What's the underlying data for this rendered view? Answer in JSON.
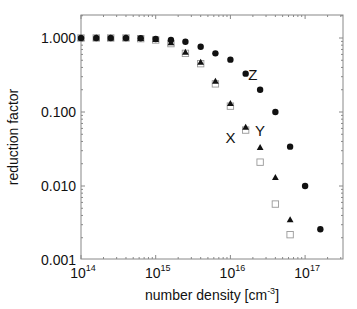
{
  "chart_data": {
    "type": "scatter",
    "title": "",
    "xlabel": "number density [cm^-3]",
    "xlabel_base": "number density [cm",
    "xlabel_sup": "-3",
    "xlabel_end": "]",
    "ylabel": "reduction factor",
    "xscale": "log",
    "yscale": "log",
    "xlim": [
      100000000000000.0,
      2.5e+17
    ],
    "ylim": [
      0.001,
      1.5
    ],
    "x_ticks": [
      {
        "value": 100000000000000.0,
        "base": "10",
        "exp": "14"
      },
      {
        "value": 1000000000000000.0,
        "base": "10",
        "exp": "15"
      },
      {
        "value": 1e+16,
        "base": "10",
        "exp": "16"
      },
      {
        "value": 1e+17,
        "base": "10",
        "exp": "17"
      }
    ],
    "y_ticks": [
      {
        "value": 1.0,
        "label": "1.000"
      },
      {
        "value": 0.1,
        "label": "0.100"
      },
      {
        "value": 0.01,
        "label": "0.010"
      },
      {
        "value": 0.001,
        "label": "0.001"
      }
    ],
    "grid": false,
    "legend": "none",
    "annotations": [
      {
        "text": "Z",
        "x": 2e+16,
        "y": 0.32
      },
      {
        "text": "X",
        "x": 1e+16,
        "y": 0.045
      },
      {
        "text": "Y",
        "x": 2.5e+16,
        "y": 0.055
      }
    ],
    "series": [
      {
        "name": "Z",
        "marker": "filled-circle",
        "x": [
          100000000000000.0,
          160000000000000.0,
          250000000000000.0,
          400000000000000.0,
          630000000000000.0,
          1000000000000000.0,
          1600000000000000.0,
          2500000000000000.0,
          4000000000000000.0,
          6300000000000000.0,
          1e+16,
          1.6e+16,
          2.5e+16,
          4e+16,
          6.3e+16,
          1e+17,
          1.6e+17
        ],
        "y": [
          1.0,
          1.0,
          1.0,
          1.0,
          0.99,
          0.97,
          0.94,
          0.89,
          0.76,
          0.62,
          0.51,
          0.33,
          0.2,
          0.1,
          0.034,
          0.01,
          0.0026
        ]
      },
      {
        "name": "X",
        "marker": "filled-triangle",
        "x": [
          100000000000000.0,
          160000000000000.0,
          250000000000000.0,
          400000000000000.0,
          630000000000000.0,
          1000000000000000.0,
          1600000000000000.0,
          2500000000000000.0,
          4000000000000000.0,
          6300000000000000.0,
          1e+16,
          1.6e+16,
          2.5e+16,
          4e+16,
          6.3e+16
        ],
        "y": [
          1.0,
          1.0,
          1.0,
          1.0,
          0.98,
          0.95,
          0.86,
          0.64,
          0.47,
          0.26,
          0.13,
          0.062,
          0.033,
          0.013,
          0.0035
        ]
      },
      {
        "name": "Y",
        "marker": "open-square",
        "x": [
          100000000000000.0,
          160000000000000.0,
          250000000000000.0,
          400000000000000.0,
          630000000000000.0,
          1000000000000000.0,
          1600000000000000.0,
          2500000000000000.0,
          4000000000000000.0,
          6300000000000000.0,
          1e+16,
          1.6e+16,
          2.5e+16,
          4e+16,
          6.3e+16
        ],
        "y": [
          1.0,
          1.0,
          1.0,
          1.0,
          0.98,
          0.94,
          0.84,
          0.62,
          0.45,
          0.24,
          0.12,
          0.057,
          0.021,
          0.0057,
          0.0022
        ]
      }
    ]
  }
}
